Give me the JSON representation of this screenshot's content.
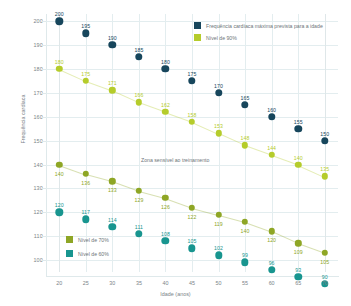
{
  "chart_data": {
    "type": "scatter",
    "title": "",
    "xlabel": "Idade (anos)",
    "ylabel": "Frequência cardíaca",
    "x": [
      20,
      25,
      30,
      35,
      40,
      45,
      50,
      55,
      60,
      65,
      70
    ],
    "xlim": [
      17.5,
      72.5
    ],
    "ylim": [
      95,
      203
    ],
    "yticks": [
      100,
      110,
      120,
      130,
      140,
      150,
      160,
      170,
      180,
      190,
      200
    ],
    "xticks": [
      20,
      25,
      30,
      35,
      40,
      45,
      50,
      55,
      60,
      65,
      70
    ],
    "grid": true,
    "legend_position": "top-right / inner-left",
    "annotations": [
      {
        "text": "Zona sensível ao treinamento",
        "x": 42,
        "y": 140
      }
    ],
    "series": [
      {
        "name": "Frequência cardíaca máxima prevista para a idade",
        "color": "#17465c",
        "marker": "circle",
        "connected": false,
        "values": [
          200,
          195,
          190,
          185,
          180,
          175,
          170,
          165,
          160,
          155,
          150
        ],
        "labels": [
          "200",
          "195",
          "190",
          "185",
          "180",
          "175",
          "170",
          "165",
          "160",
          "155",
          "150"
        ]
      },
      {
        "name": "Nível de 90%",
        "color": "#b5cc2b",
        "marker": "circle",
        "connected": true,
        "values": [
          180,
          175,
          171,
          166,
          162,
          158,
          153,
          148,
          144,
          140,
          135
        ],
        "labels": [
          "180",
          "175",
          "171",
          "166",
          "162",
          "158",
          "153",
          "148",
          "144",
          "140",
          "135"
        ]
      },
      {
        "name": "Nível de 70%",
        "color": "#8ea625",
        "marker": "circle",
        "connected": true,
        "values": [
          140,
          136,
          133,
          129,
          126,
          122,
          119,
          116,
          112,
          107,
          103
        ],
        "labels": [
          "140",
          "136",
          "133",
          "129",
          "126",
          "122",
          "119",
          "140",
          "120",
          "109",
          "105"
        ]
      },
      {
        "name": "Nível de 60%",
        "color": "#18958f",
        "marker": "circle",
        "connected": false,
        "values": [
          120,
          117,
          114,
          111,
          108,
          105,
          102,
          99,
          96,
          93,
          90
        ],
        "labels": [
          "120",
          "117",
          "114",
          "111",
          "108",
          "105",
          "102",
          "99",
          "96",
          "93",
          "90"
        ]
      }
    ]
  },
  "legend": {
    "top": [
      {
        "label": "Frequência cardíaca máxima prevista para a idade",
        "color": "#17465c"
      },
      {
        "label": "Nível de 90%",
        "color": "#b5cc2b"
      }
    ],
    "bottom": [
      {
        "label": "Nível de 70%",
        "color": "#8ea625"
      },
      {
        "label": "Nível de 60%",
        "color": "#18958f"
      }
    ]
  },
  "colors": {
    "max_hr": "#17465c",
    "level90": "#b5cc2b",
    "level70": "#8ea625",
    "level60": "#18958f",
    "grid": "#e3edef",
    "text": "#6d7579"
  }
}
